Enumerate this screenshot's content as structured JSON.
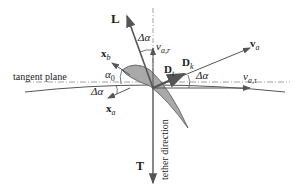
{
  "diagram": {
    "labels": {
      "lift": "L",
      "delta_alpha_top": "Δα",
      "v_a_r": "v",
      "v_a_r_sub": "a,r",
      "v_a": "v",
      "v_a_sub": "a",
      "D_k": "D",
      "D_k_sub": "k",
      "D_t": "D",
      "D_t_sub": "t",
      "x_b": "x",
      "x_b_sub": "b",
      "tangent_plane": "tangent plane",
      "alpha_0": "α",
      "alpha_0_sub": "0",
      "delta_alpha_right": "Δα",
      "v_a_tau": "v",
      "v_a_tau_sub": "a,τ",
      "delta_alpha_left": "Δα",
      "x_a": "x",
      "x_a_sub": "a",
      "tether_direction": "tether direction",
      "tension": "T"
    },
    "colors": {
      "line": "#555555",
      "airfoil_fill": "#a9a9a9",
      "text": "#222222"
    }
  }
}
